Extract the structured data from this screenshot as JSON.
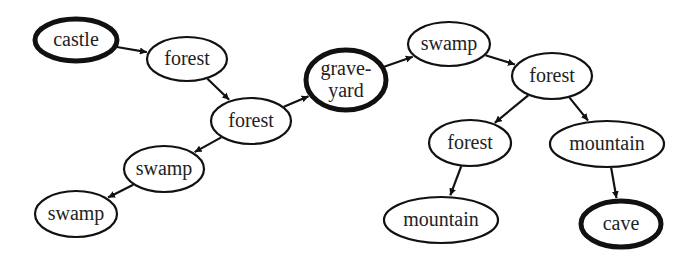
{
  "diagram": {
    "type": "directed-graph",
    "nodes": [
      {
        "id": "castle",
        "label": "castle",
        "lines": [
          "castle"
        ],
        "cx": 76,
        "cy": 40,
        "rx": 41,
        "ry": 21,
        "bold": true
      },
      {
        "id": "forest1",
        "label": "forest",
        "lines": [
          "forest"
        ],
        "cx": 187,
        "cy": 59,
        "rx": 40,
        "ry": 22,
        "bold": false
      },
      {
        "id": "forest2",
        "label": "forest",
        "lines": [
          "forest"
        ],
        "cx": 251,
        "cy": 121,
        "rx": 40,
        "ry": 23,
        "bold": false
      },
      {
        "id": "swamp1",
        "label": "swamp",
        "lines": [
          "swamp"
        ],
        "cx": 164,
        "cy": 169,
        "rx": 40,
        "ry": 23,
        "bold": false
      },
      {
        "id": "swamp2",
        "label": "swamp",
        "lines": [
          "swamp"
        ],
        "cx": 76,
        "cy": 214,
        "rx": 41,
        "ry": 23,
        "bold": false
      },
      {
        "id": "graveyard",
        "label": "grave-yard",
        "lines": [
          "grave-",
          "yard"
        ],
        "cx": 346,
        "cy": 80,
        "rx": 40,
        "ry": 30,
        "bold": true
      },
      {
        "id": "swamp3",
        "label": "swamp",
        "lines": [
          "swamp"
        ],
        "cx": 449,
        "cy": 44,
        "rx": 41,
        "ry": 22,
        "bold": false
      },
      {
        "id": "forest3",
        "label": "forest",
        "lines": [
          "forest"
        ],
        "cx": 552,
        "cy": 76,
        "rx": 40,
        "ry": 23,
        "bold": false
      },
      {
        "id": "forest4",
        "label": "forest",
        "lines": [
          "forest"
        ],
        "cx": 470,
        "cy": 143,
        "rx": 41,
        "ry": 23,
        "bold": false
      },
      {
        "id": "mountain1",
        "label": "mountain",
        "lines": [
          "mountain"
        ],
        "cx": 607,
        "cy": 144,
        "rx": 57,
        "ry": 23,
        "bold": false
      },
      {
        "id": "mountain2",
        "label": "mountain",
        "lines": [
          "mountain"
        ],
        "cx": 441,
        "cy": 220,
        "rx": 57,
        "ry": 23,
        "bold": false
      },
      {
        "id": "cave",
        "label": "cave",
        "lines": [
          "cave"
        ],
        "cx": 621,
        "cy": 224,
        "rx": 40,
        "ry": 23,
        "bold": true
      }
    ],
    "edges": [
      {
        "from": "castle",
        "to": "forest1"
      },
      {
        "from": "forest1",
        "to": "forest2"
      },
      {
        "from": "forest2",
        "to": "swamp1"
      },
      {
        "from": "swamp1",
        "to": "swamp2"
      },
      {
        "from": "forest2",
        "to": "graveyard"
      },
      {
        "from": "graveyard",
        "to": "swamp3"
      },
      {
        "from": "swamp3",
        "to": "forest3"
      },
      {
        "from": "forest3",
        "to": "forest4"
      },
      {
        "from": "forest3",
        "to": "mountain1"
      },
      {
        "from": "forest4",
        "to": "mountain2"
      },
      {
        "from": "mountain1",
        "to": "cave"
      }
    ],
    "style": {
      "stroke_color": "#111111",
      "normal_stroke_width": 2.2,
      "bold_stroke_width": 5,
      "background": "#ffffff"
    }
  }
}
